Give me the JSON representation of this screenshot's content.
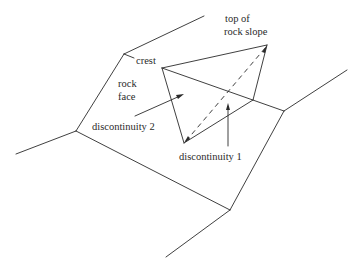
{
  "diagram": {
    "type": "rock slope wedge failure sketch",
    "labels": {
      "top_of_line1": "top of",
      "top_of_line2": "rock slope",
      "crest": "crest",
      "rock_face_line1": "rock",
      "rock_face_line2": "face",
      "discontinuity_2": "discontinuity 2",
      "discontinuity_1": "discontinuity 1"
    },
    "colors": {
      "line": "#2a2a2a",
      "background": "#ffffff"
    }
  }
}
